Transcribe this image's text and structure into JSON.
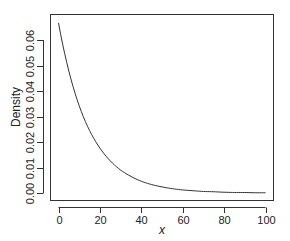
{
  "chart_data": {
    "type": "line",
    "title": "",
    "xlabel": "x",
    "ylabel": "Density",
    "xlim": [
      0,
      100
    ],
    "ylim": [
      0,
      0.067
    ],
    "grid": false,
    "legend": null,
    "x_ticks": [
      0,
      20,
      40,
      60,
      80,
      100
    ],
    "x_tick_labels": [
      "0",
      "20",
      "40",
      "60",
      "80",
      "100"
    ],
    "y_ticks": [
      0.0,
      0.01,
      0.02,
      0.03,
      0.04,
      0.05,
      0.06
    ],
    "y_tick_labels": [
      "0.00",
      "0.01",
      "0.02",
      "0.03",
      "0.04",
      "0.05",
      "0.06"
    ],
    "series": [
      {
        "name": "exponential density (rate ≈ 1/15)",
        "x": [
          0,
          5,
          10,
          15,
          20,
          25,
          30,
          35,
          40,
          45,
          50,
          55,
          60,
          65,
          70,
          75,
          80,
          85,
          90,
          95,
          100
        ],
        "values": [
          0.0667,
          0.0478,
          0.0342,
          0.0245,
          0.0176,
          0.0126,
          0.009,
          0.0065,
          0.0046,
          0.0033,
          0.0024,
          0.0017,
          0.0012,
          0.0009,
          0.0006,
          0.0005,
          0.0003,
          0.0002,
          0.0002,
          0.0001,
          0.0001
        ]
      }
    ]
  },
  "colors": {
    "line": "#333333",
    "axis": "#333333",
    "background": "#ffffff"
  }
}
